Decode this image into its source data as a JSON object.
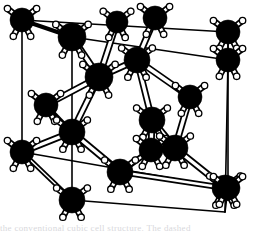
{
  "figure": {
    "name": "diamond-cubic-unit-cell",
    "kind": "3d-ball-and-stick-lattice",
    "background_color": "#ffffff",
    "atom_color": "#000000",
    "bond_outline_color": "#000000",
    "bond_fill_color": "#ffffff",
    "cell_edge_color": "#000000",
    "atom_radius_px": 11,
    "stub_color_fill": "#ffffff",
    "stub_color_stroke": "#000000"
  },
  "caption": {
    "partial_text": "the conventional cubic cell structure. The dashed"
  },
  "projection": {
    "description": "oblique axonometric projection of a cube",
    "origin_x": 22,
    "origin_y": 152,
    "axis_x_px": [
      203,
      188
    ],
    "axis_y_px": [
      22,
      20
    ],
    "axis_z_px": [
      50,
      168
    ],
    "note": "screen = origin + u*axis_x + v*axis_y + w*axis_z with u,v,w in [0,1]"
  },
  "cell_corners": [
    {
      "label": "back-bottom-left",
      "frac": [
        0,
        0,
        0
      ],
      "x": 22,
      "y": 152
    },
    {
      "label": "back-bottom-right",
      "frac": [
        1,
        0,
        0
      ],
      "x": 228,
      "y": 188
    },
    {
      "label": "back-top-left",
      "frac": [
        0,
        1,
        0
      ],
      "x": 22,
      "y": 20
    },
    {
      "label": "back-top-right",
      "frac": [
        1,
        1,
        0
      ],
      "x": 228,
      "y": 32
    },
    {
      "label": "front-bottom-left",
      "frac": [
        0,
        0,
        1
      ],
      "x": 72,
      "y": 200
    },
    {
      "label": "front-bottom-right",
      "frac": [
        1,
        0,
        1
      ],
      "x": 225,
      "y": 212
    },
    {
      "label": "front-top-left",
      "frac": [
        0,
        1,
        1
      ],
      "x": 72,
      "y": 37
    },
    {
      "label": "front-top-right",
      "frac": [
        1,
        1,
        1
      ],
      "x": 228,
      "y": 60
    }
  ],
  "cell_edges": [
    [
      0,
      1
    ],
    [
      0,
      2
    ],
    [
      0,
      4
    ],
    [
      1,
      3
    ],
    [
      1,
      5
    ],
    [
      2,
      3
    ],
    [
      2,
      6
    ],
    [
      3,
      7
    ],
    [
      4,
      5
    ],
    [
      4,
      6
    ],
    [
      5,
      7
    ],
    [
      6,
      7
    ]
  ],
  "atoms": [
    {
      "id": "a0",
      "kind": "corner",
      "x": 22,
      "y": 20,
      "r": 12
    },
    {
      "id": "a1",
      "kind": "corner",
      "x": 72,
      "y": 37,
      "r": 14
    },
    {
      "id": "a2",
      "kind": "edge",
      "x": 117,
      "y": 22,
      "r": 11
    },
    {
      "id": "a3",
      "kind": "edge",
      "x": 155,
      "y": 18,
      "r": 12
    },
    {
      "id": "a4",
      "kind": "corner",
      "x": 228,
      "y": 32,
      "r": 12
    },
    {
      "id": "a5",
      "kind": "interior",
      "x": 137,
      "y": 60,
      "r": 13
    },
    {
      "id": "a6",
      "kind": "interior",
      "x": 99,
      "y": 77,
      "r": 14
    },
    {
      "id": "a7",
      "kind": "face",
      "x": 46,
      "y": 105,
      "r": 12
    },
    {
      "id": "a8",
      "kind": "interior",
      "x": 190,
      "y": 97,
      "r": 12
    },
    {
      "id": "a9",
      "kind": "interior",
      "x": 152,
      "y": 120,
      "r": 13
    },
    {
      "id": "a10",
      "kind": "face",
      "x": 72,
      "y": 132,
      "r": 13
    },
    {
      "id": "a11",
      "kind": "corner",
      "x": 22,
      "y": 152,
      "r": 12
    },
    {
      "id": "a12",
      "kind": "interior",
      "x": 151,
      "y": 150,
      "r": 12
    },
    {
      "id": "a13",
      "kind": "interior",
      "x": 175,
      "y": 148,
      "r": 13
    },
    {
      "id": "a14",
      "kind": "face",
      "x": 120,
      "y": 172,
      "r": 13
    },
    {
      "id": "a15",
      "kind": "corner",
      "x": 72,
      "y": 200,
      "r": 13
    },
    {
      "id": "a16",
      "kind": "corner",
      "x": 225,
      "y": 188,
      "r": 13
    },
    {
      "id": "a17",
      "kind": "corner",
      "x": 228,
      "y": 60,
      "r": 12
    },
    {
      "id": "a18",
      "kind": "corner",
      "x": 228,
      "y": 188,
      "r": 12
    }
  ],
  "bonds": [
    {
      "from": "a1",
      "to": "a6",
      "w": 7
    },
    {
      "from": "a2",
      "to": "a6",
      "w": 7
    },
    {
      "from": "a3",
      "to": "a5",
      "w": 7
    },
    {
      "from": "a5",
      "to": "a6",
      "w": 7
    },
    {
      "from": "a5",
      "to": "a8",
      "w": 7
    },
    {
      "from": "a5",
      "to": "a9",
      "w": 7
    },
    {
      "from": "a6",
      "to": "a7",
      "w": 7
    },
    {
      "from": "a6",
      "to": "a10",
      "w": 7
    },
    {
      "from": "a8",
      "to": "a13",
      "w": 7
    },
    {
      "from": "a9",
      "to": "a13",
      "w": 7
    },
    {
      "from": "a9",
      "to": "a12",
      "w": 7
    },
    {
      "from": "a10",
      "to": "a11",
      "w": 7
    },
    {
      "from": "a10",
      "to": "a14",
      "w": 7
    },
    {
      "from": "a12",
      "to": "a13",
      "w": 6
    },
    {
      "from": "a13",
      "to": "a16",
      "w": 7
    },
    {
      "from": "a12",
      "to": "a14",
      "w": 6
    },
    {
      "from": "a11",
      "to": "a15",
      "w": 5
    },
    {
      "from": "a14",
      "to": "a16",
      "w": 6
    },
    {
      "from": "a1",
      "to": "a0",
      "w": 4
    },
    {
      "from": "a7",
      "to": "a10",
      "w": 4
    }
  ],
  "stubs": {
    "count_per_atom": 4,
    "length_px": 9,
    "tip_radius_px": 3.2,
    "description": "four short white bond stubs radiating from each atom"
  }
}
